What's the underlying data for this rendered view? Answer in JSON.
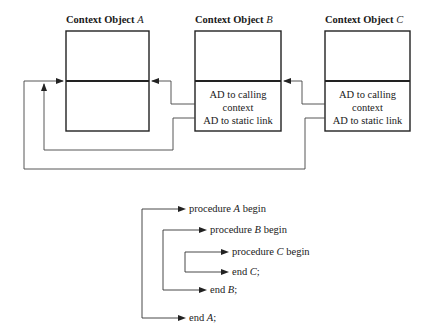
{
  "diagram": {
    "context_objects": [
      {
        "id": "A",
        "title_prefix": "Context Object",
        "title_var": "A",
        "cells": []
      },
      {
        "id": "B",
        "title_prefix": "Context Object",
        "title_var": "B",
        "cells": [
          "AD to calling",
          "context",
          "AD to static link"
        ]
      },
      {
        "id": "C",
        "title_prefix": "Context Object",
        "title_var": "C",
        "cells": [
          "AD to calling",
          "context",
          "AD to static link"
        ]
      }
    ],
    "links": [
      {
        "from": "B",
        "to": "A",
        "kind": "calling context"
      },
      {
        "from": "B",
        "to": "A",
        "kind": "static link"
      },
      {
        "from": "C",
        "to": "B",
        "kind": "calling context"
      },
      {
        "from": "C",
        "to": "A",
        "kind": "static link"
      }
    ],
    "procedures": [
      {
        "prefix": "procedure",
        "var": "A",
        "suffix": "begin"
      },
      {
        "prefix": "procedure",
        "var": "B",
        "suffix": "begin"
      },
      {
        "prefix": "procedure",
        "var": "C",
        "suffix": "begin"
      },
      {
        "prefix": "end",
        "var": "C",
        "suffix": ";"
      },
      {
        "prefix": "end",
        "var": "B",
        "suffix": ";"
      },
      {
        "prefix": "end",
        "var": "A",
        "suffix": ";"
      }
    ]
  }
}
